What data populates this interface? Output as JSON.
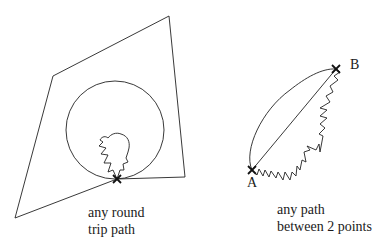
{
  "left_panel": {
    "caption_line1": "any round",
    "caption_line2": "trip path",
    "shapes": [
      "quadrilateral-loop",
      "circle-loop",
      "zigzag-loop"
    ],
    "junction": "cross-mark"
  },
  "right_panel": {
    "point_a": "A",
    "point_b": "B",
    "caption_line1": "any path",
    "caption_line2": "between 2 points",
    "paths": [
      "curved-arc",
      "straight-line",
      "zigzag-path"
    ]
  },
  "colors": {
    "stroke": "#222222",
    "background": "#ffffff"
  }
}
